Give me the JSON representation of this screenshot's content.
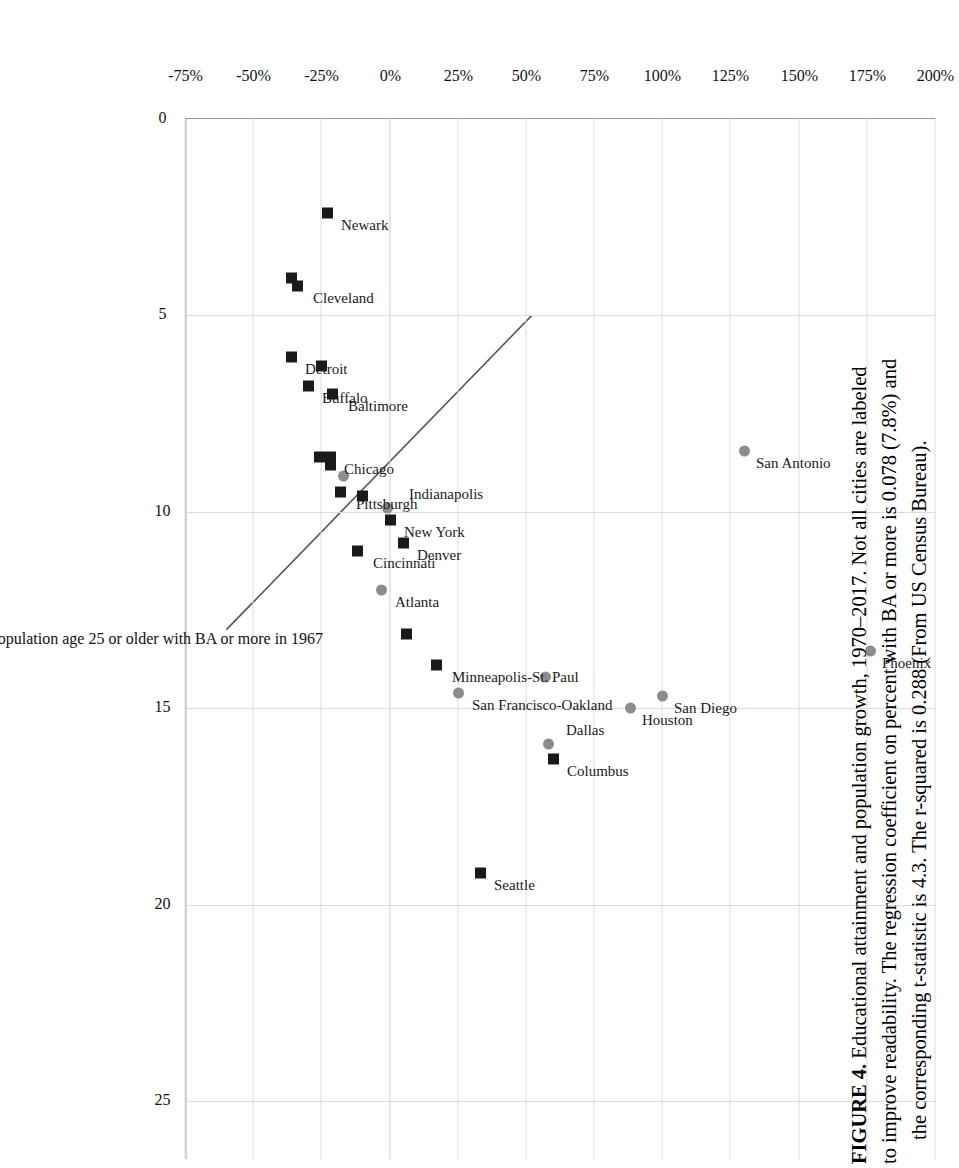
{
  "figure": {
    "caption_label": "FIGURE 4.",
    "caption_lines": [
      "Educational attainment and population growth, 1970–2017. Not all cities are labeled",
      "to improve readability. The regression coefficient on percent with BA or more is 0.078 (7.8%) and",
      "the corresponding t-statistic is 4.3. The r-squared is 0.288 (From US Census Bureau)."
    ],
    "caption_full": "FIGURE 4. Educational attainment and population growth, 1970–2017. Not all cities are labeled to improve readability. The regression coefficient on percent with BA or more is 0.078 (7.8%) and the corresponding t-statistic is 4.3. The r-squared is 0.288 (From US Census Bureau).",
    "source": "From US Census Bureau",
    "rotation": "90deg"
  },
  "chart_data": {
    "type": "scatter",
    "title": "",
    "xlabel": "Percent of population age 25 or older with BA or more in 1967",
    "ylabel": "",
    "xlim": [
      0,
      26.5
    ],
    "ylim": [
      -75,
      200
    ],
    "xticks": [
      0,
      5,
      10,
      15,
      20,
      25
    ],
    "xticklabels": [
      "0",
      "5",
      "10",
      "15",
      "20",
      "25"
    ],
    "yticks": [
      -75,
      -50,
      -25,
      0,
      25,
      50,
      75,
      100,
      125,
      150,
      175,
      200
    ],
    "yticklabels": [
      "-75%",
      "-50%",
      "-25%",
      "0%",
      "25%",
      "50%",
      "75%",
      "100%",
      "125%",
      "150%",
      "175%",
      "200%"
    ],
    "grid": true,
    "legend": false,
    "marker_styles": {
      "square": "#1a1a1a",
      "circle": "#8c8c8c"
    },
    "trendline": {
      "slope": 7.8,
      "intercept": 146,
      "x_start": 5.0,
      "x_end": 13.0,
      "note": "regression coefficient 0.078 (7.8% per point)"
    },
    "stats": {
      "coefficient": "0.078",
      "coefficient_pct": "7.8%",
      "t_statistic": "4.3",
      "r_squared": "0.288"
    },
    "points": [
      {
        "label": "Phoenix",
        "x": 13.55,
        "y": 176,
        "marker": "circle",
        "lx": 12,
        "ly": 20
      },
      {
        "label": "San Antonio",
        "x": 8.45,
        "y": 130,
        "marker": "circle",
        "lx": 12,
        "ly": 20
      },
      {
        "label": "San Diego",
        "x": 14.7,
        "y": 100,
        "marker": "circle",
        "lx": 12,
        "ly": 20
      },
      {
        "label": "Houston",
        "x": 15.0,
        "y": 88,
        "marker": "circle",
        "lx": 12,
        "ly": 20
      },
      {
        "label": "Columbus",
        "x": 16.3,
        "y": 60,
        "marker": "square",
        "lx": 12,
        "ly": 22
      },
      {
        "label": "Dallas",
        "x": 15.9,
        "y": 58,
        "marker": "circle",
        "lx": -14,
        "ly": 26
      },
      {
        "label": "",
        "x": 14.2,
        "y": 57,
        "marker": "circle",
        "lx": 0,
        "ly": 0
      },
      {
        "label": "Seattle",
        "x": 19.2,
        "y": 33,
        "marker": "square",
        "lx": 12,
        "ly": 22
      },
      {
        "label": "San Francisco-Oakland",
        "x": 14.6,
        "y": 25,
        "marker": "circle",
        "lx": 12,
        "ly": 22
      },
      {
        "label": "Minneapolis-St. Paul",
        "x": 13.9,
        "y": 17,
        "marker": "square",
        "lx": 12,
        "ly": 24
      },
      {
        "label": "",
        "x": 13.1,
        "y": 6,
        "marker": "square",
        "lx": 0,
        "ly": 0
      },
      {
        "label": "Denver",
        "x": 10.8,
        "y": 5,
        "marker": "square",
        "lx": 12,
        "ly": 22
      },
      {
        "label": "Atlanta",
        "x": 12.0,
        "y": -3,
        "marker": "circle",
        "lx": 12,
        "ly": 22
      },
      {
        "label": "Cincinnati",
        "x": 11.0,
        "y": -12,
        "marker": "square",
        "lx": 12,
        "ly": 24
      },
      {
        "label": "New York",
        "x": 10.2,
        "y": 0,
        "marker": "square",
        "lx": 12,
        "ly": 22
      },
      {
        "label": "Indianapolis",
        "x": 9.9,
        "y": -1,
        "marker": "circle",
        "lx": -14,
        "ly": 30
      },
      {
        "label": "",
        "x": 9.6,
        "y": -10,
        "marker": "square",
        "lx": 0,
        "ly": 0
      },
      {
        "label": "Pittsburgh",
        "x": 9.5,
        "y": -18,
        "marker": "square",
        "lx": 12,
        "ly": 24
      },
      {
        "label": "",
        "x": 9.1,
        "y": -17,
        "marker": "circle",
        "lx": 0,
        "ly": 0
      },
      {
        "label": "",
        "x": 8.8,
        "y": -22,
        "marker": "square",
        "lx": 0,
        "ly": 0
      },
      {
        "label": "Chicago",
        "x": 8.6,
        "y": -22,
        "marker": "square",
        "lx": 12,
        "ly": 22
      },
      {
        "label": "",
        "x": 8.6,
        "y": -26,
        "marker": "square",
        "lx": 0,
        "ly": 0
      },
      {
        "label": "Baltimore",
        "x": 7.0,
        "y": -21,
        "marker": "square",
        "lx": 12,
        "ly": 24
      },
      {
        "label": "Buffalo",
        "x": 6.8,
        "y": -30,
        "marker": "square",
        "lx": 12,
        "ly": 22
      },
      {
        "label": "",
        "x": 6.3,
        "y": -25,
        "marker": "square",
        "lx": 0,
        "ly": 0
      },
      {
        "label": "Detroit",
        "x": 6.05,
        "y": -36,
        "marker": "square",
        "lx": 12,
        "ly": 22
      },
      {
        "label": "Cleveland",
        "x": 4.25,
        "y": -34,
        "marker": "square",
        "lx": 12,
        "ly": 24
      },
      {
        "label": "",
        "x": 4.05,
        "y": -36,
        "marker": "square",
        "lx": 0,
        "ly": 0
      },
      {
        "label": "Newark",
        "x": 2.4,
        "y": -23,
        "marker": "square",
        "lx": 12,
        "ly": 22
      }
    ]
  }
}
